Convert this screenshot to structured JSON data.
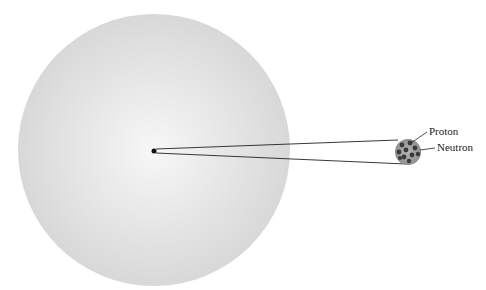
{
  "diagram": {
    "labels": {
      "proton": "Proton",
      "neutron": "Neutron"
    },
    "colors": {
      "atom_center": "#f6f6f6",
      "atom_edge": "#d9d9d9",
      "nucleus_fill": "#9a9a9a",
      "particle": "#3a3a3a",
      "line": "#222222"
    }
  }
}
